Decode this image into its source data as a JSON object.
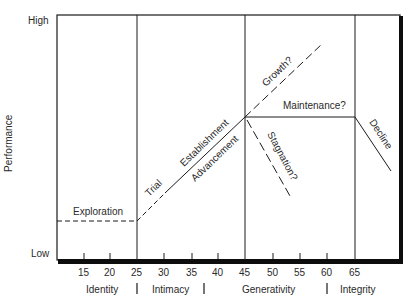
{
  "diagram": {
    "y_axis": {
      "label": "Performance",
      "high": "High",
      "low": "Low"
    },
    "x_axis": {
      "ticks": [
        "15",
        "20",
        "25",
        "30",
        "35",
        "40",
        "45",
        "50",
        "55",
        "60",
        "65"
      ],
      "stages": [
        "Identity",
        "Intimacy",
        "Generativity",
        "Integrity"
      ]
    },
    "phases": {
      "exploration": "Exploration",
      "trial": "Trial",
      "establishment": "Establishment",
      "advancement": "Advancement",
      "growth": "Growth?",
      "maintenance": "Maintenance?",
      "stagnation": "Stagnation?",
      "decline": "Decline"
    }
  }
}
